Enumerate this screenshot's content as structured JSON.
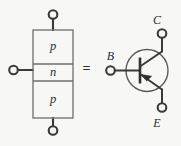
{
  "figure": {
    "equals_sign": "=",
    "background_color": "#f7f7f5",
    "line_color": "#3a3a3a",
    "block_outline_color": "#6e6e6e",
    "label_color": "#2b2b2b"
  },
  "block_diagram": {
    "name": "pnp-layer-stack",
    "layers": [
      {
        "id": "collector-layer",
        "label": "p"
      },
      {
        "id": "base-layer",
        "label": "n"
      },
      {
        "id": "emitter-layer",
        "label": "p"
      }
    ],
    "terminals": [
      {
        "id": "top-terminal",
        "label": ""
      },
      {
        "id": "side-terminal",
        "label": ""
      },
      {
        "id": "bottom-terminal",
        "label": ""
      }
    ]
  },
  "symbol": {
    "name": "pnp-transistor-symbol",
    "device_type": "PNP",
    "terminals": [
      {
        "id": "collector",
        "label": "C"
      },
      {
        "id": "base",
        "label": "B"
      },
      {
        "id": "emitter",
        "label": "E"
      }
    ],
    "arrow_direction": "into-base"
  }
}
